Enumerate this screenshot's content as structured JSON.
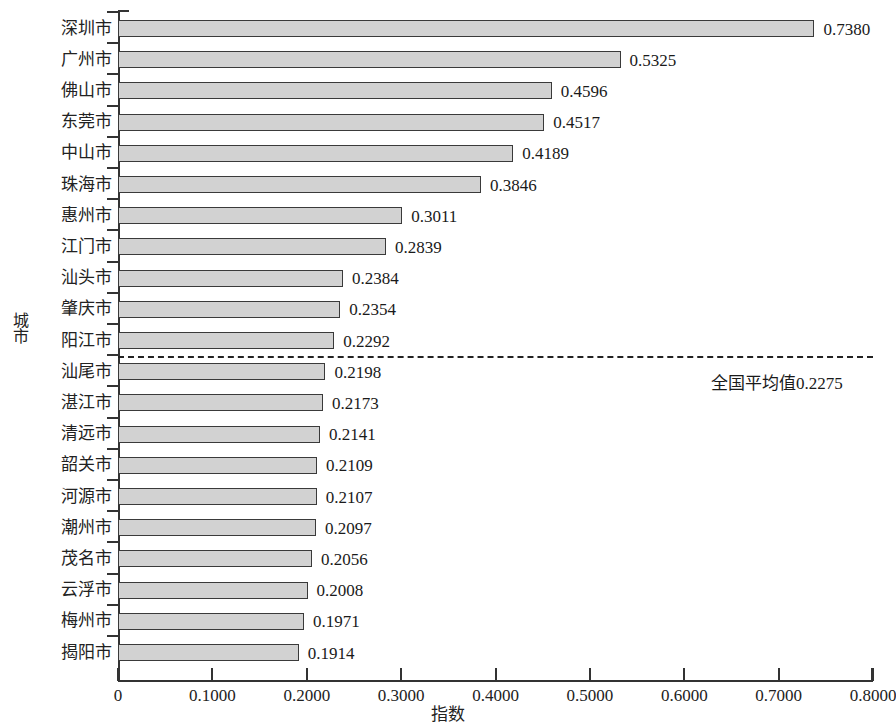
{
  "chart_data": {
    "type": "bar",
    "orientation": "horizontal",
    "title": "",
    "xlabel": "指数",
    "ylabel": "城市",
    "xlim": [
      0,
      0.8
    ],
    "xtick_labels": [
      "0",
      "0.1000",
      "0.2000",
      "0.3000",
      "0.4000",
      "0.5000",
      "0.6000",
      "0.7000",
      "0.8000"
    ],
    "xtick_values": [
      0,
      0.1,
      0.2,
      0.3,
      0.4,
      0.5,
      0.6,
      0.7,
      0.8
    ],
    "grid": false,
    "legend": null,
    "categories": [
      "深圳市",
      "广州市",
      "佛山市",
      "东莞市",
      "中山市",
      "珠海市",
      "惠州市",
      "江门市",
      "汕头市",
      "肇庆市",
      "阳江市",
      "汕尾市",
      "湛江市",
      "清远市",
      "韶关市",
      "河源市",
      "潮州市",
      "茂名市",
      "云浮市",
      "梅州市",
      "揭阳市"
    ],
    "values": [
      0.738,
      0.5325,
      0.4596,
      0.4517,
      0.4189,
      0.3846,
      0.3011,
      0.2839,
      0.2384,
      0.2354,
      0.2292,
      0.2198,
      0.2173,
      0.2141,
      0.2109,
      0.2107,
      0.2097,
      0.2056,
      0.2008,
      0.1971,
      0.1914
    ],
    "value_labels": [
      "0.7380",
      "0.5325",
      "0.4596",
      "0.4517",
      "0.4189",
      "0.3846",
      "0.3011",
      "0.2839",
      "0.2384",
      "0.2354",
      "0.2292",
      "0.2198",
      "0.2173",
      "0.2141",
      "0.2109",
      "0.2107",
      "0.2097",
      "0.2056",
      "0.2008",
      "0.1971",
      "0.1914"
    ],
    "bar_color": "#d2d2d2",
    "bar_edge_color": "#3a3a3a",
    "annotations": [
      {
        "type": "reference-line",
        "style": "dashed",
        "label": "全国平均值0.2275",
        "value": 0.2275,
        "after_category_index": 10
      }
    ]
  }
}
